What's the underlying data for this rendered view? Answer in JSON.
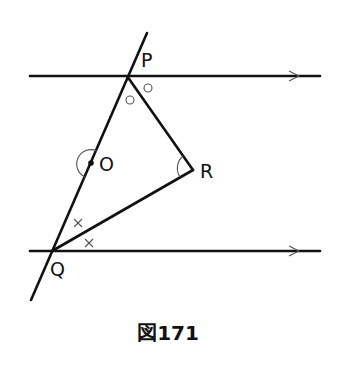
{
  "diagram": {
    "caption": "図171",
    "points": {
      "P": {
        "label": "P",
        "x": 127,
        "y": 76
      },
      "Q": {
        "label": "Q",
        "x": 52,
        "y": 251
      },
      "R": {
        "label": "R",
        "x": 193,
        "y": 170
      },
      "O": {
        "label": "O",
        "x": 91,
        "y": 163
      }
    },
    "lines": {
      "top_parallel": {
        "x1": 30,
        "y1": 76,
        "x2": 320,
        "y2": 76,
        "arrow_x": 297
      },
      "bottom_parallel": {
        "x1": 30,
        "y1": 251,
        "x2": 320,
        "y2": 251,
        "arrow_x": 297
      },
      "transversal": {
        "x1": 147,
        "y1": 33,
        "x2": 31,
        "y2": 300
      }
    },
    "segments": [
      "PR",
      "RQ",
      "PQ"
    ],
    "angle_marks": {
      "P_circles": "○",
      "Q_crosses": "×",
      "O_arc": "arc",
      "R_arc": "arc"
    },
    "colors": {
      "line": "#111111",
      "mark": "#555555",
      "background": "#ffffff"
    }
  }
}
